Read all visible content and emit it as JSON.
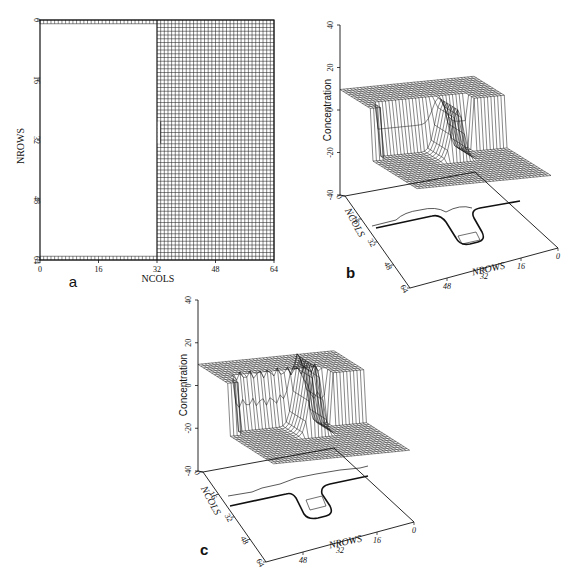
{
  "figure": {
    "panels": [
      {
        "id": "a",
        "label": "a"
      },
      {
        "id": "b",
        "label": "b"
      },
      {
        "id": "c",
        "label": "c"
      }
    ]
  },
  "chart_data": [
    {
      "panel": "a",
      "type": "heatmap",
      "title": "",
      "description": "64x64 model grid; left half (cols 0-32) inactive/blank except first and last rows; right half (cols 32-64) active grid cells; small notch near rows 27-33 where boundary shifts one column right",
      "xlabel": "NCOLS",
      "ylabel": "NROWS",
      "xticks": [
        0,
        16,
        32,
        48,
        64
      ],
      "yticks": [
        0,
        16,
        32,
        48,
        64
      ],
      "xlim": [
        0,
        64
      ],
      "ylim": [
        64,
        0
      ],
      "grid_cells": 64,
      "active_region": {
        "col_start": 32,
        "col_end": 64,
        "row_start": 0,
        "row_end": 64
      },
      "boundary_rows": [
        0,
        63
      ],
      "notch": {
        "row_start": 27,
        "row_end": 33,
        "col": 33
      }
    },
    {
      "panel": "b",
      "type": "surface3d",
      "title": "",
      "zlabel": "Concentration",
      "xlabel": "NROWS",
      "ylabel": "NCOLS",
      "zticks": [
        40,
        20,
        0,
        -20,
        -40
      ],
      "zlim": [
        -40,
        40
      ],
      "xticks": [
        48,
        32,
        16,
        0
      ],
      "yticks": [
        0,
        16,
        32,
        48,
        64
      ],
      "plateau_high": 12,
      "plateau_low": -12,
      "peak_value": 12,
      "contour_base": true
    },
    {
      "panel": "c",
      "type": "surface3d",
      "title": "",
      "zlabel": "Concentration",
      "xlabel": "NROWS",
      "ylabel": "NCOLS",
      "zticks": [
        40,
        20,
        0,
        -20,
        -40
      ],
      "zlim": [
        -40,
        40
      ],
      "xticks": [
        48,
        32,
        16,
        0
      ],
      "yticks": [
        0,
        16,
        32,
        48,
        64
      ],
      "plateau_high": 12,
      "plateau_low": -12,
      "peak_value": 20,
      "contour_base": true
    }
  ],
  "labels": {
    "a_xlabel": "NCOLS",
    "a_ylabel": "NROWS",
    "b_zlabel": "Concentration",
    "b_xlabel": "NROWS",
    "b_ylabel": "NCOLS",
    "c_zlabel": "Concentration",
    "c_xlabel": "NROWS",
    "c_ylabel": "NCOLS",
    "a_xticks": [
      "0",
      "16",
      "32",
      "48",
      "64"
    ],
    "a_yticks": [
      "0",
      "16",
      "32",
      "48",
      "64"
    ],
    "z_ticks": [
      "40",
      "20",
      "0",
      "-20",
      "-40"
    ],
    "row_ticks": [
      "48",
      "32",
      "16",
      "0"
    ],
    "col_ticks": [
      "0",
      "16",
      "32",
      "48",
      "64"
    ]
  }
}
